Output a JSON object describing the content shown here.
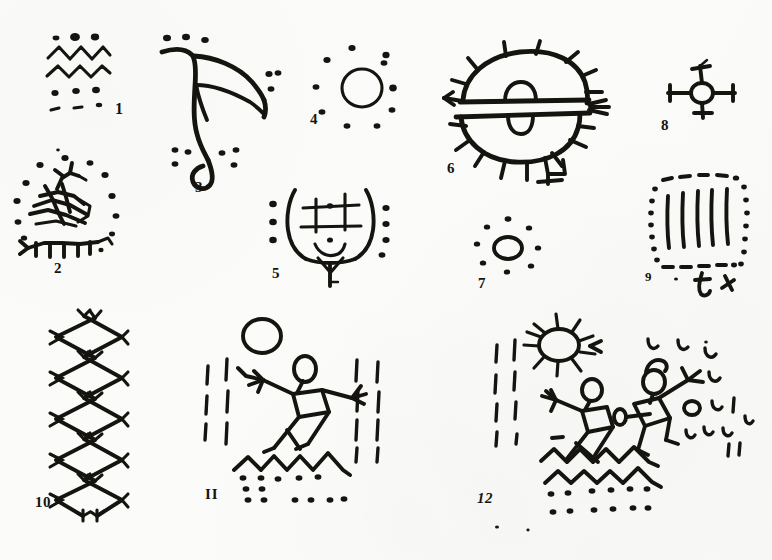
{
  "plate": {
    "medium": "scanned pen-and-ink line drawing",
    "background_color": "#fbfbf9",
    "ink_color": "#15140f",
    "width": 772,
    "height": 560,
    "caption": "",
    "figure_count": 12
  },
  "figures": [
    {
      "id": "1",
      "label": "1",
      "name": "zigzag-and-dot-panel",
      "description": "Three dots over two horizontal zigzag bands, with two rows of dots beneath",
      "elements": [
        "3 top dots",
        "2 zigzag lines",
        "row of 3 dots",
        "row of 3 dashes"
      ]
    },
    {
      "id": "2",
      "label": "2",
      "name": "quadruped-in-dot-ring",
      "description": "Antlered quadruped figure encircled by a ring of dots",
      "elements": [
        "quadruped body",
        "antlers",
        "legs",
        "ring of 12 dots"
      ]
    },
    {
      "id": "3",
      "label": "3",
      "name": "hooked-curvilinear-glyph",
      "description": "Large hooked curvilinear glyph with triangular web, flanked by dot clusters",
      "elements": [
        "3 top dots",
        "curved hook stem",
        "triangular web",
        "2 lower dot clusters",
        "right dot cluster"
      ]
    },
    {
      "id": "4",
      "label": "4",
      "name": "circle-in-dot-ring",
      "description": "Open circle surrounded by a ring of ten dots",
      "elements": [
        "circle",
        "ring of 10 dots"
      ]
    },
    {
      "id": "5",
      "label": "5",
      "name": "mask-face-glyph",
      "description": "U-shaped mask face with grid eyes, center dot, smile arc and flanking dot columns",
      "elements": [
        "U outline",
        "grid of lines",
        "dot pupils",
        "smile arc",
        "3 left dots",
        "4 right dots",
        "stem"
      ]
    },
    {
      "id": "6",
      "label": "6",
      "name": "rayed-oval-glyph",
      "description": "Large oval divided by a double horizontal band, with radiating rays and two arch marks inside",
      "elements": [
        "upper lobe",
        "lower lobe",
        "double horizontal band",
        "radiating rays",
        "2 arch marks"
      ]
    },
    {
      "id": "7",
      "label": "7",
      "name": "small-circle-in-dot-ring",
      "description": "Small open circle surrounded by a ring of eight dots",
      "elements": [
        "small circle",
        "ring of 8 dots"
      ]
    },
    {
      "id": "8",
      "label": "8",
      "name": "crossed-spoke-circle",
      "description": "Small circle with four spokes, each tipped with a crossbar",
      "elements": [
        "circle",
        "4 spokes",
        "4 crossbars"
      ]
    },
    {
      "id": "9",
      "label": "9",
      "name": "dotted-rectangle-with-strokes",
      "description": "Dotted and dashed rectangular border enclosing six vertical strokes, with a t-mark below",
      "elements": [
        "dotted border",
        "6 vertical strokes",
        "t-shaped mark",
        "small tick"
      ]
    },
    {
      "id": "10",
      "label": "10",
      "name": "double-zigzag-column",
      "description": "Two tall vertical zigzag columns with bird-foot crossbars at each vertex",
      "elements": [
        "left zigzag column",
        "right zigzag column",
        "vertex crossbars"
      ]
    },
    {
      "id": "11",
      "label": "II",
      "name": "figure-with-circle-and-water-band",
      "description": "Circle above a splay-limbed stick figure with square torso, flanked by dash columns, over a zigzag water band with dot rows",
      "elements": [
        "circle",
        "stick figure",
        "left dash column",
        "right dash column",
        "zigzag band",
        "2 dot rows"
      ]
    },
    {
      "id": "12",
      "label": "12",
      "name": "sun-figures-and-water-scene",
      "description": "Rayed sun with two splay-limbed stick figures, dash column at left, scattered u-marks at right, over two zigzag water bands with dot rows",
      "elements": [
        "rayed sun",
        "2 stick figures",
        "left dash column",
        "right u-marks",
        "2 zigzag bands",
        "2 dot rows"
      ]
    }
  ]
}
